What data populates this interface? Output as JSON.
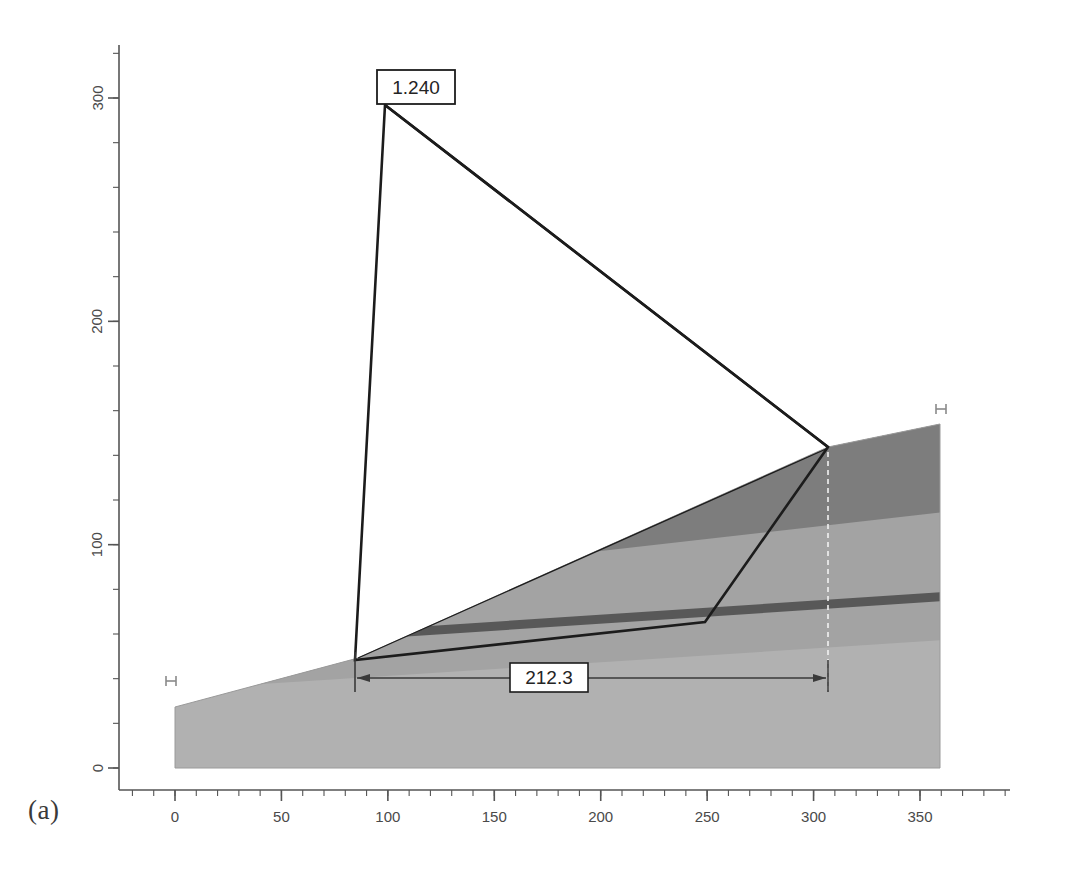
{
  "figure": {
    "caption": "(a)",
    "type": "slope-stability-cross-section",
    "background_color": "#ffffff"
  },
  "axes": {
    "x": {
      "ticks": [
        "0",
        "50",
        "100",
        "150",
        "200",
        "250",
        "300",
        "350"
      ],
      "tick_values": [
        0,
        50,
        100,
        150,
        200,
        250,
        300,
        350
      ],
      "minor_ticks_per_major": 5,
      "range": [
        -15,
        375
      ],
      "axis_color": "#555555"
    },
    "y": {
      "ticks": [
        "0",
        "100",
        "200",
        "300"
      ],
      "tick_values": [
        0,
        100,
        200,
        300
      ],
      "minor_ticks_per_major": 5,
      "range": [
        -12,
        330
      ],
      "orientation": "rotated",
      "axis_color": "#555555"
    }
  },
  "labels": {
    "factor_of_safety": "1.240",
    "slide_width": "212.3"
  },
  "chart_data": {
    "type": "line",
    "title": "",
    "xlabel": "",
    "ylabel": "",
    "xlim": [
      -15,
      375
    ],
    "ylim": [
      -12,
      330
    ],
    "grid": false,
    "legend": "none",
    "annotations": [
      {
        "name": "factor-of-safety",
        "text": "1.240",
        "x": 96,
        "y": 300
      },
      {
        "name": "slide-width",
        "text": "212.3",
        "x": 186,
        "y": 27
      }
    ],
    "series": [
      {
        "name": "ground-surface",
        "comment": "top profile of slope from left crest to right crest",
        "x": [
          0,
          80,
          290,
          342
        ],
        "y": [
          33,
          47,
          140,
          155
        ]
      },
      {
        "name": "slip-surface",
        "comment": "failure wedge boundary: apex down left side, along weak layer, up to crest",
        "x": [
          96,
          80,
          237,
          290
        ],
        "y": [
          300,
          47,
          58,
          140
        ]
      },
      {
        "name": "wedge-top-chord",
        "comment": "straight chord from apex to crest vertex",
        "x": [
          96,
          290
        ],
        "y": [
          300,
          140
        ]
      },
      {
        "name": "weak-layer-top",
        "comment": "thin dark seam running through the slope",
        "x": [
          0,
          342
        ],
        "y": [
          25,
          70
        ]
      },
      {
        "name": "layer2-top",
        "comment": "boundary between upper dark unit and middle lighter unit",
        "x": [
          0,
          342
        ],
        "y": [
          31,
          92
        ]
      }
    ]
  },
  "layers": [
    {
      "name": "upper-unit",
      "color": "#7d7d7d"
    },
    {
      "name": "middle-unit",
      "color": "#a3a3a3"
    },
    {
      "name": "weak-seam",
      "color": "#585858"
    },
    {
      "name": "base-unit",
      "color": "#b1b1b1"
    }
  ],
  "markers": {
    "left_boundary": "H",
    "right_boundary": "H"
  },
  "style": {
    "line_color": "#1c1c1c",
    "dimension_color": "#3a3a3a",
    "label_box_fill": "#ffffff",
    "label_box_border": "#1c1c1c",
    "extension_line_color": "#f2f2f2"
  }
}
